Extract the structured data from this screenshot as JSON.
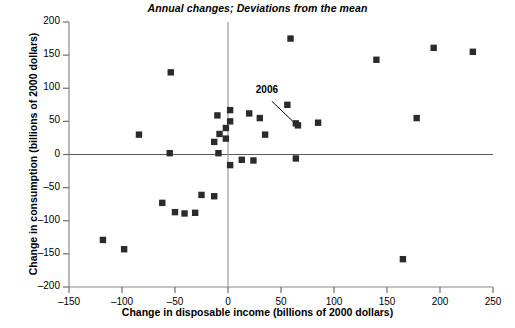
{
  "chart_data": {
    "type": "scatter",
    "title": "Annual changes; Deviations from the mean",
    "xlabel": "Change in disposable income (billions of 2000 dollars)",
    "ylabel": "Change in consumption (billions of 2000 dollars)",
    "xlim": [
      -150,
      250
    ],
    "ylim": [
      -200,
      200
    ],
    "xticks": [
      -150,
      -100,
      -50,
      0,
      50,
      100,
      150,
      200,
      250
    ],
    "yticks": [
      -200,
      -150,
      -100,
      -50,
      0,
      50,
      100,
      150,
      200
    ],
    "xtick_labels": [
      "–150",
      "–100",
      "–50",
      "0",
      "50",
      "100",
      "150",
      "200",
      "250"
    ],
    "ytick_labels": [
      "–200",
      "–150",
      "–100",
      "–50",
      "0",
      "50",
      "100",
      "150",
      "200"
    ],
    "grid": false,
    "legend": null,
    "marker": "square",
    "marker_color": "#2b2b2b",
    "zero_lines": {
      "horizontal": 0,
      "vertical": 0
    },
    "points": [
      {
        "x": -118,
        "y": -129
      },
      {
        "x": -98,
        "y": -143
      },
      {
        "x": -84,
        "y": 30
      },
      {
        "x": -54,
        "y": 124
      },
      {
        "x": -62,
        "y": -73
      },
      {
        "x": -55,
        "y": 2
      },
      {
        "x": -50,
        "y": -87
      },
      {
        "x": -41,
        "y": -89
      },
      {
        "x": -31,
        "y": -88
      },
      {
        "x": -25,
        "y": -61
      },
      {
        "x": -13,
        "y": -63
      },
      {
        "x": -10,
        "y": 59
      },
      {
        "x": -9,
        "y": 2
      },
      {
        "x": -8,
        "y": 31
      },
      {
        "x": -13,
        "y": 19
      },
      {
        "x": -2,
        "y": 40
      },
      {
        "x": -2,
        "y": 24
      },
      {
        "x": 2,
        "y": 67
      },
      {
        "x": 2,
        "y": 50
      },
      {
        "x": 2,
        "y": -16
      },
      {
        "x": 13,
        "y": -8
      },
      {
        "x": 24,
        "y": -9
      },
      {
        "x": 20,
        "y": 62
      },
      {
        "x": 30,
        "y": 55
      },
      {
        "x": 35,
        "y": 30
      },
      {
        "x": 59,
        "y": 175
      },
      {
        "x": 56,
        "y": 75
      },
      {
        "x": 64,
        "y": 47
      },
      {
        "x": 66,
        "y": 44
      },
      {
        "x": 64,
        "y": -6
      },
      {
        "x": 85,
        "y": 48
      },
      {
        "x": 140,
        "y": 143
      },
      {
        "x": 165,
        "y": -158
      },
      {
        "x": 178,
        "y": 55
      },
      {
        "x": 194,
        "y": 161
      },
      {
        "x": 231,
        "y": 155
      }
    ],
    "annotations": [
      {
        "label": "2006",
        "point": {
          "x": 64,
          "y": 44
        },
        "label_position": {
          "x": 30,
          "y": 88
        }
      }
    ]
  }
}
